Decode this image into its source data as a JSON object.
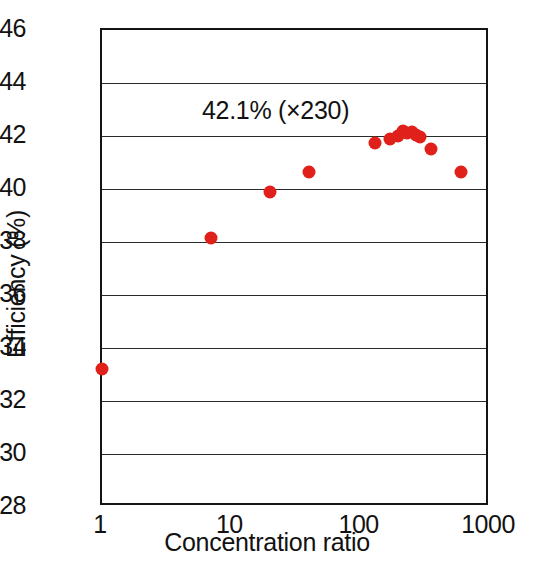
{
  "chart_data": {
    "type": "scatter",
    "title": "",
    "xlabel": "Concentration ratio",
    "ylabel": "Efficiency (%)",
    "xscale": "log",
    "xlim": [
      1,
      1000
    ],
    "ylim": [
      28,
      46
    ],
    "xticks": [
      "1",
      "10",
      "100",
      "1000"
    ],
    "xtick_values": [
      1,
      10,
      100,
      1000
    ],
    "yticks": [
      "28",
      "30",
      "32",
      "34",
      "36",
      "38",
      "40",
      "42",
      "44",
      "46"
    ],
    "ytick_values": [
      28,
      30,
      32,
      34,
      36,
      38,
      40,
      42,
      44,
      46
    ],
    "grid": "horizontal",
    "legend": "none",
    "marker_color": "#e0201b",
    "annotations": [
      {
        "text": "42.1% (×230)",
        "x": 22,
        "y": 43.0
      }
    ],
    "series": [
      {
        "name": "Efficiency vs concentration ratio",
        "points": [
          {
            "x": 1,
            "y": 33.2
          },
          {
            "x": 7,
            "y": 38.15
          },
          {
            "x": 20,
            "y": 39.9
          },
          {
            "x": 40,
            "y": 40.65
          },
          {
            "x": 130,
            "y": 41.75
          },
          {
            "x": 170,
            "y": 41.9
          },
          {
            "x": 195,
            "y": 42.0
          },
          {
            "x": 212,
            "y": 42.2
          },
          {
            "x": 230,
            "y": 42.1
          },
          {
            "x": 248,
            "y": 42.15
          },
          {
            "x": 268,
            "y": 42.05
          },
          {
            "x": 290,
            "y": 41.95
          },
          {
            "x": 350,
            "y": 41.5
          },
          {
            "x": 600,
            "y": 40.65
          }
        ]
      }
    ]
  }
}
